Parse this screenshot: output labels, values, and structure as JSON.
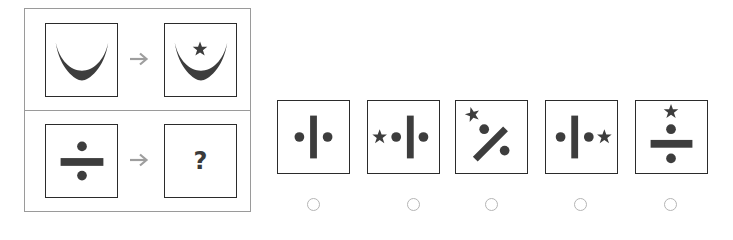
{
  "puzzle": {
    "example": {
      "source_figure": "crescent",
      "target_figure": "crescent-with-star",
      "arrow_icon": "right-arrow-icon"
    },
    "question": {
      "source_figure": "division-sign",
      "target_placeholder": "?",
      "arrow_icon": "right-arrow-icon"
    }
  },
  "options": [
    {
      "id": "A",
      "figure": "vertical-bar-with-two-dots"
    },
    {
      "id": "B",
      "figure": "star-left-of-vertical-bar-with-dots"
    },
    {
      "id": "C",
      "figure": "percent-sign-with-star"
    },
    {
      "id": "D",
      "figure": "star-right-of-vertical-bar-with-dots"
    },
    {
      "id": "E",
      "figure": "division-sign-with-star-on-top"
    }
  ],
  "colors": {
    "shape_fill": "#3d3d3d",
    "box_border": "#2b2b2b",
    "frame_border": "#9a9a9a",
    "arrow": "#9e9e9e",
    "radio_border": "#b5b5b5"
  }
}
